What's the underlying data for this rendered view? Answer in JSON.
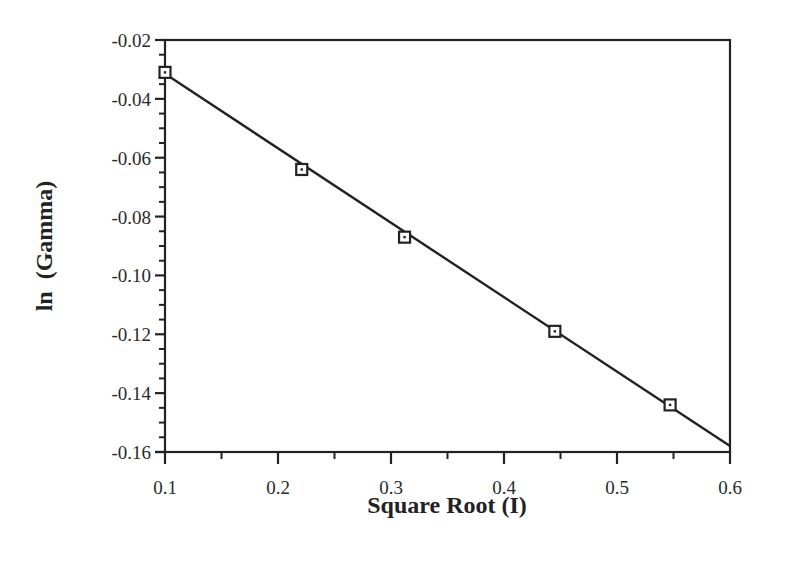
{
  "chart_data": {
    "type": "scatter",
    "title": "",
    "xlabel": "Square Root (I)",
    "ylabel": "ln  (Gamma)",
    "xlim": [
      0.1,
      0.6
    ],
    "ylim": [
      -0.16,
      -0.02
    ],
    "grid": false,
    "legend": null,
    "x_ticks": [
      "0.1",
      "0.2",
      "0.3",
      "0.4",
      "0.5",
      "0.6"
    ],
    "y_ticks": [
      "-0.02",
      "-0.04",
      "-0.06",
      "-0.08",
      "-0.10",
      "-0.12",
      "-0.14",
      "-0.16"
    ],
    "series": [
      {
        "name": "data",
        "marker": "open-square",
        "x": [
          0.1,
          0.221,
          0.312,
          0.445,
          0.547
        ],
        "y": [
          -0.031,
          -0.064,
          -0.087,
          -0.119,
          -0.144
        ]
      },
      {
        "name": "linear-fit",
        "style": "line",
        "x": [
          0.1,
          0.6
        ],
        "y": [
          -0.0315,
          -0.158
        ]
      }
    ]
  },
  "colors": {
    "axis": "#222222",
    "line": "#222222",
    "marker": "#222222",
    "background": "#ffffff"
  }
}
